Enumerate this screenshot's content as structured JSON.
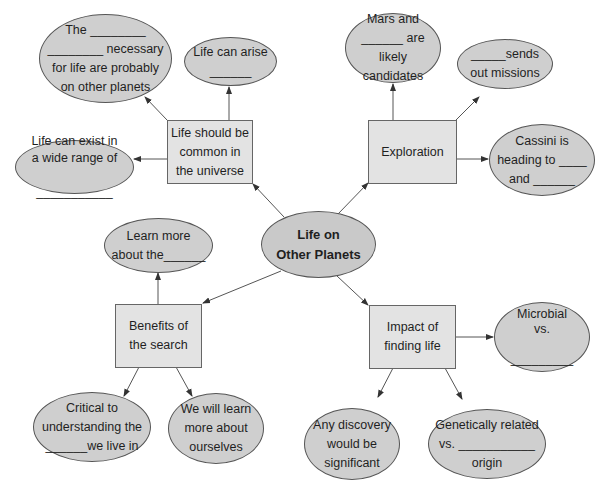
{
  "central": {
    "label": "Life on\nOther Planets"
  },
  "branches": [
    {
      "id": "common",
      "label": "Life should be\ncommon in\nthe universe",
      "children": [
        {
          "label": "The ________\n________ necessary\nfor life are probably\non other planets"
        },
        {
          "label": "Life can arise\n______"
        },
        {
          "label": "Life can exist in\na wide range of\n\n___________"
        }
      ]
    },
    {
      "id": "exploration",
      "label": "Exploration",
      "children": [
        {
          "label": "Mars and\n______ are likely\ncandidates"
        },
        {
          "label": "_____sends\nout missions"
        },
        {
          "label": "Cassini is\nheading to ____\nand ______"
        }
      ]
    },
    {
      "id": "benefits",
      "label": "Benefits of\nthe search",
      "children": [
        {
          "label": "Learn more\nabout the______"
        },
        {
          "label": "Critical to\nunderstanding the\n______we live in"
        },
        {
          "label": "We will learn\nmore about\nourselves"
        }
      ]
    },
    {
      "id": "impact",
      "label": "Impact of\nfinding life",
      "children": [
        {
          "label": "Microbial\nvs.\n\n_________"
        },
        {
          "label": "Any discovery\nwould be\nsignificant"
        },
        {
          "label": "Genetically related\nvs. ___________\norigin"
        }
      ]
    }
  ],
  "colors": {
    "ellipse_fill": "#cfcfcf",
    "box_fill": "#e3e3e3",
    "stroke": "#555555"
  }
}
